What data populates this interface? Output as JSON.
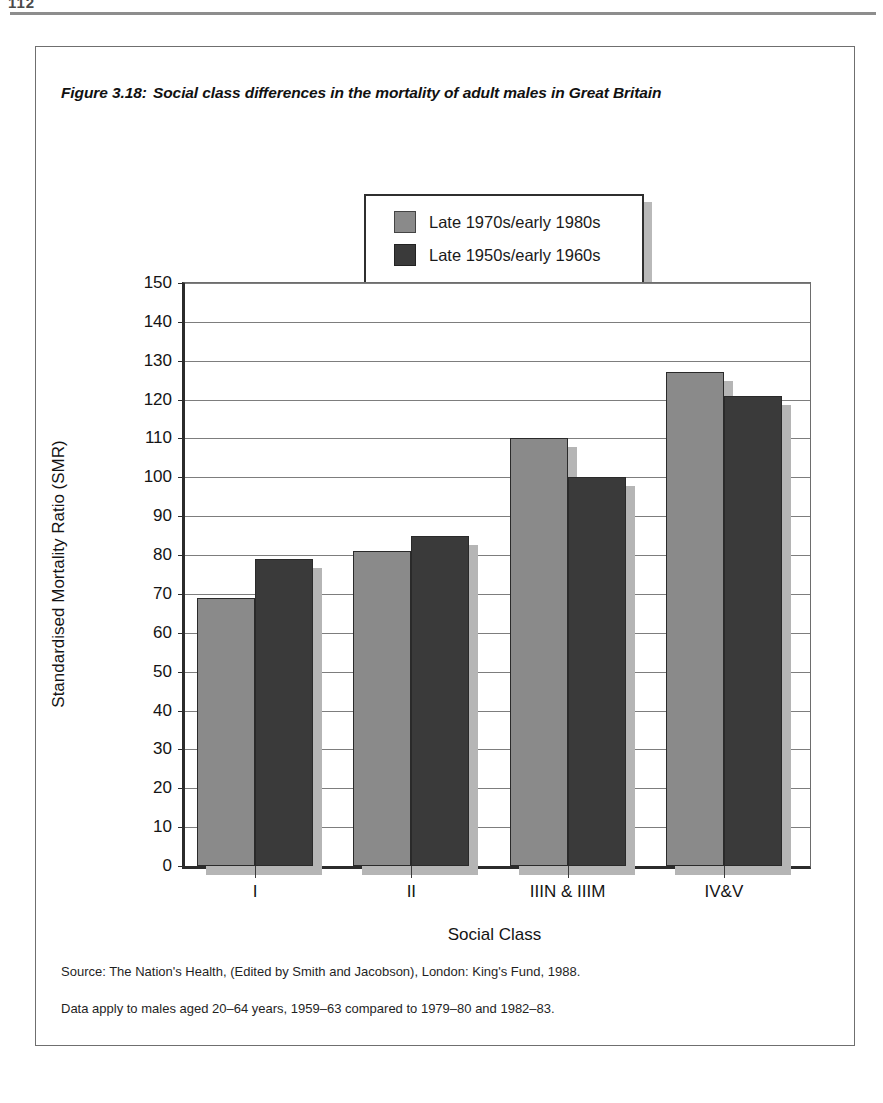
{
  "page": {
    "number": "112",
    "rule": "header-rule"
  },
  "figure": {
    "number": "Figure 3.18:",
    "title": "Social class differences in the mortality of adult males in Great Britain"
  },
  "legend": {
    "position": "top-center",
    "items": [
      {
        "label": "Late 1970s/early 1980s",
        "color": "#8a8a8a"
      },
      {
        "label": "Late 1950s/early 1960s",
        "color": "#3a3a3a"
      }
    ]
  },
  "notes": {
    "source": "Source: The Nation's Health, (Edited by Smith and Jacobson),  London: King's Fund, 1988.",
    "data": "Data apply to males aged 20–64 years, 1959–63 compared to 1979–80 and 1982–83."
  },
  "chart_data": {
    "type": "bar",
    "title": "Social class differences in the mortality of adult males in Great Britain",
    "xlabel": "Social Class",
    "ylabel": "Standardised Mortality Ratio (SMR)",
    "categories": [
      "I",
      "II",
      "IIIN & IIIM",
      "IV&V"
    ],
    "series": [
      {
        "name": "Late 1970s/early 1980s",
        "color": "#8a8a8a",
        "values": [
          69,
          81,
          110,
          127
        ]
      },
      {
        "name": "Late 1950s/early 1960s",
        "color": "#3a3a3a",
        "values": [
          79,
          85,
          100,
          121
        ]
      }
    ],
    "ylim": [
      0,
      150
    ],
    "ytick_step": 10,
    "yticks": [
      0,
      10,
      20,
      30,
      40,
      50,
      60,
      70,
      80,
      90,
      100,
      110,
      120,
      130,
      140,
      150
    ],
    "ytick_labels": [
      "0",
      "10",
      "20",
      "30",
      "40",
      "50",
      "60",
      "70",
      "80",
      "90",
      "100",
      "110",
      "120",
      "130",
      "140",
      "150"
    ],
    "grid": true,
    "grid_axis": "y",
    "legend_position": "top-center",
    "bar_shadow": true
  }
}
